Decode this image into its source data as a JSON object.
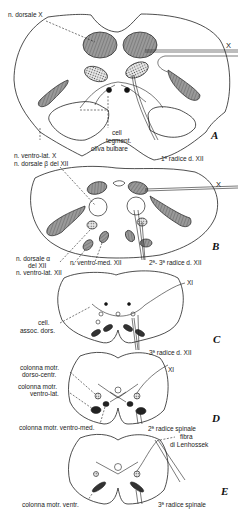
{
  "figure": {
    "panels": [
      {
        "id": "A",
        "letter": "A",
        "labels": {
          "n_dorsale_x": "n. dorsale  X",
          "x_right": "X",
          "cell_tegment_1": "cell",
          "cell_tegment_2": "tegment.",
          "oliva": "oliva bulbare",
          "ventro_lat_x": "n. ventro-lat. X",
          "dorsale_beta": "n. dorsale β del XII",
          "radice": "1ª radice d. XII"
        }
      },
      {
        "id": "B",
        "letter": "B",
        "labels": {
          "x_right": "X",
          "dorsale_alpha_1": "n. dorsale α",
          "dorsale_alpha_2": "del XII",
          "ventro_lat": "n. ventro-lat. XII",
          "ventro_med": "n. ventro-med. XII",
          "radice": "2ª- 3ª radice d. XII"
        }
      },
      {
        "id": "C",
        "letter": "C",
        "labels": {
          "xi": "XI",
          "cell_assoc_1": "cell.",
          "cell_assoc_2": "assoc. dors.",
          "radice": "3ª radice d. XII"
        }
      },
      {
        "id": "D",
        "letter": "D",
        "labels": {
          "xi": "XI",
          "dorso_centr_1": "colonna motr.",
          "dorso_centr_2": "dorso-centr.",
          "ventro_lat_1": "colonna motr.",
          "ventro_lat_2": "ventro-lat.",
          "ventro_med": "colonna motr. ventro-med.",
          "radice": "2ª radice spinale"
        }
      },
      {
        "id": "E",
        "letter": "E",
        "labels": {
          "fibra_1": "fibra",
          "fibra_2": "di Lenhossek",
          "ventr": "colonna motr. ventr.",
          "radice": "3ª radice spinale"
        }
      }
    ],
    "colors": {
      "ink": "#222222",
      "shade": "#8a8a8a",
      "dark": "#3a3a3a",
      "background": "#ffffff"
    }
  }
}
